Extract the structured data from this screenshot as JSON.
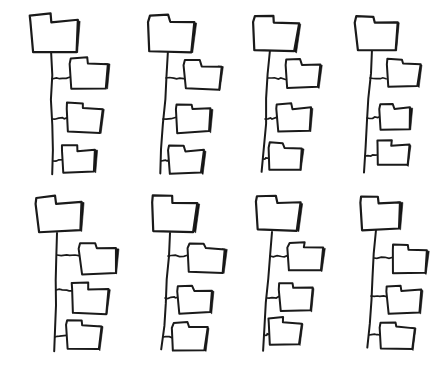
{
  "document": {
    "title": "Hand-drawn folder tree diagrams",
    "description": "A grid of eight hand-drawn folder hierarchy sketches, each showing one parent folder connected by a vertical trunk line to three child folders.",
    "background_color": "#ffffff",
    "ink_color": "#1a1a1a",
    "shadow_color": "#111111",
    "canvas": {
      "width": 447,
      "height": 375
    }
  },
  "layout": {
    "type": "grid",
    "columns": 4,
    "rows": 2,
    "total_trees": 8,
    "children_per_tree": 3
  },
  "icons": {
    "folder": "folder-icon",
    "trunk": "tree-trunk-line",
    "branch": "tree-branch-line"
  },
  "trees": [
    {
      "id": "tree-1",
      "row": 1,
      "column": 1,
      "parent": {
        "label": "folder-parent",
        "x": 30,
        "y": 14,
        "w": 48,
        "h": 38,
        "tilt": -1.5,
        "shadow_w": 8
      },
      "trunk": {
        "x1": 51,
        "y1": 50,
        "x2": 53,
        "y2": 174,
        "width": 2.0
      },
      "children": [
        {
          "label": "folder-child",
          "x": 70,
          "y": 58,
          "w": 38,
          "h": 30,
          "tilt": -1.0,
          "shadow_w": 7,
          "branch": {
            "x1": 52,
            "y1": 79,
            "x2": 70,
            "y2": 78,
            "width": 1.7
          }
        },
        {
          "label": "folder-child",
          "x": 66,
          "y": 103,
          "w": 36,
          "h": 29,
          "tilt": 1.0,
          "shadow_w": 7,
          "branch": {
            "x1": 52,
            "y1": 119,
            "x2": 68,
            "y2": 118,
            "width": 1.7
          }
        },
        {
          "label": "folder-child",
          "x": 62,
          "y": 145,
          "w": 34,
          "h": 27,
          "tilt": -1.5,
          "shadow_w": 6,
          "branch": {
            "x1": 53,
            "y1": 161,
            "x2": 64,
            "y2": 160,
            "width": 1.7
          }
        }
      ]
    },
    {
      "id": "tree-2",
      "row": 1,
      "column": 2,
      "parent": {
        "label": "folder-parent",
        "x": 148,
        "y": 15,
        "w": 46,
        "h": 36,
        "tilt": 1.2,
        "shadow_w": 8
      },
      "trunk": {
        "x1": 168,
        "y1": 50,
        "x2": 160,
        "y2": 174,
        "width": 2.0
      },
      "children": [
        {
          "label": "folder-child",
          "x": 184,
          "y": 60,
          "w": 37,
          "h": 29,
          "tilt": 1.5,
          "shadow_w": 7,
          "branch": {
            "x1": 166,
            "y1": 78,
            "x2": 184,
            "y2": 79,
            "width": 1.7
          }
        },
        {
          "label": "folder-child",
          "x": 176,
          "y": 104,
          "w": 35,
          "h": 28,
          "tilt": -1.2,
          "shadow_w": 7,
          "branch": {
            "x1": 163,
            "y1": 119,
            "x2": 177,
            "y2": 118,
            "width": 1.7
          }
        },
        {
          "label": "folder-child",
          "x": 168,
          "y": 145,
          "w": 36,
          "h": 28,
          "tilt": 1.0,
          "shadow_w": 6,
          "branch": {
            "x1": 161,
            "y1": 161,
            "x2": 170,
            "y2": 160,
            "width": 1.7
          }
        }
      ]
    },
    {
      "id": "tree-3",
      "row": 1,
      "column": 3,
      "parent": {
        "label": "folder-parent",
        "x": 253,
        "y": 16,
        "w": 45,
        "h": 35,
        "tilt": 2.0,
        "shadow_w": 8
      },
      "trunk": {
        "x1": 270,
        "y1": 50,
        "x2": 262,
        "y2": 172,
        "width": 2.0
      },
      "children": [
        {
          "label": "folder-child",
          "x": 285,
          "y": 59,
          "w": 35,
          "h": 28,
          "tilt": 1.0,
          "shadow_w": 7,
          "branch": {
            "x1": 268,
            "y1": 78,
            "x2": 285,
            "y2": 79,
            "width": 1.7
          }
        },
        {
          "label": "folder-child",
          "x": 277,
          "y": 103,
          "w": 34,
          "h": 28,
          "tilt": -1.5,
          "shadow_w": 7,
          "branch": {
            "x1": 265,
            "y1": 119,
            "x2": 278,
            "y2": 118,
            "width": 1.7
          }
        },
        {
          "label": "folder-child",
          "x": 268,
          "y": 143,
          "w": 34,
          "h": 26,
          "tilt": 1.5,
          "shadow_w": 6,
          "branch": {
            "x1": 263,
            "y1": 159,
            "x2": 270,
            "y2": 158,
            "width": 1.7
          }
        }
      ]
    },
    {
      "id": "tree-4",
      "row": 1,
      "column": 4,
      "parent": {
        "label": "folder-parent",
        "x": 355,
        "y": 16,
        "w": 42,
        "h": 34,
        "tilt": -1.0,
        "shadow_w": 8
      },
      "trunk": {
        "x1": 372,
        "y1": 49,
        "x2": 364,
        "y2": 172,
        "width": 2.0
      },
      "children": [
        {
          "label": "folder-child",
          "x": 387,
          "y": 59,
          "w": 33,
          "h": 27,
          "tilt": 1.2,
          "shadow_w": 6,
          "branch": {
            "x1": 370,
            "y1": 78,
            "x2": 387,
            "y2": 78,
            "width": 1.7
          }
        },
        {
          "label": "folder-child",
          "x": 379,
          "y": 103,
          "w": 32,
          "h": 26,
          "tilt": -1.0,
          "shadow_w": 6,
          "branch": {
            "x1": 367,
            "y1": 118,
            "x2": 380,
            "y2": 117,
            "width": 1.7
          }
        },
        {
          "label": "folder-child",
          "x": 377,
          "y": 140,
          "w": 32,
          "h": 25,
          "tilt": 1.0,
          "shadow_w": 6,
          "branch": {
            "x1": 365,
            "y1": 156,
            "x2": 378,
            "y2": 155,
            "width": 1.7
          }
        }
      ]
    },
    {
      "id": "tree-5",
      "row": 2,
      "column": 1,
      "parent": {
        "label": "folder-parent",
        "x": 36,
        "y": 196,
        "w": 46,
        "h": 35,
        "tilt": -1.8,
        "shadow_w": 8
      },
      "trunk": {
        "x1": 57,
        "y1": 233,
        "x2": 55,
        "y2": 352,
        "width": 2.0
      },
      "children": [
        {
          "label": "folder-child",
          "x": 79,
          "y": 243,
          "w": 38,
          "h": 30,
          "tilt": -1.0,
          "shadow_w": 7,
          "branch": {
            "x1": 57,
            "y1": 255,
            "x2": 79,
            "y2": 255,
            "width": 1.7
          }
        },
        {
          "label": "folder-child",
          "x": 71,
          "y": 283,
          "w": 37,
          "h": 30,
          "tilt": 1.2,
          "shadow_w": 7,
          "branch": {
            "x1": 56,
            "y1": 290,
            "x2": 73,
            "y2": 290,
            "width": 1.7
          }
        },
        {
          "label": "folder-child",
          "x": 66,
          "y": 320,
          "w": 35,
          "h": 29,
          "tilt": 1.5,
          "shadow_w": 6,
          "branch": {
            "x1": 55,
            "y1": 337,
            "x2": 68,
            "y2": 336,
            "width": 1.7
          }
        }
      ]
    },
    {
      "id": "tree-6",
      "row": 2,
      "column": 2,
      "parent": {
        "label": "folder-parent",
        "x": 152,
        "y": 196,
        "w": 45,
        "h": 35,
        "tilt": 1.5,
        "shadow_w": 8
      },
      "trunk": {
        "x1": 170,
        "y1": 233,
        "x2": 162,
        "y2": 350,
        "width": 2.0
      },
      "children": [
        {
          "label": "folder-child",
          "x": 188,
          "y": 243,
          "w": 37,
          "h": 29,
          "tilt": 1.0,
          "shadow_w": 7,
          "branch": {
            "x1": 168,
            "y1": 256,
            "x2": 188,
            "y2": 256,
            "width": 1.7
          }
        },
        {
          "label": "folder-child",
          "x": 178,
          "y": 286,
          "w": 34,
          "h": 27,
          "tilt": -1.2,
          "shadow_w": 7,
          "branch": {
            "x1": 165,
            "y1": 298,
            "x2": 179,
            "y2": 297,
            "width": 1.7
          }
        },
        {
          "label": "folder-child",
          "x": 172,
          "y": 322,
          "w": 35,
          "h": 28,
          "tilt": 1.0,
          "shadow_w": 6,
          "branch": {
            "x1": 163,
            "y1": 337,
            "x2": 174,
            "y2": 337,
            "width": 1.7
          }
        }
      ]
    },
    {
      "id": "tree-7",
      "row": 2,
      "column": 3,
      "parent": {
        "label": "folder-parent",
        "x": 256,
        "y": 196,
        "w": 44,
        "h": 34,
        "tilt": 1.2,
        "shadow_w": 8
      },
      "trunk": {
        "x1": 272,
        "y1": 232,
        "x2": 263,
        "y2": 350,
        "width": 2.0
      },
      "children": [
        {
          "label": "folder-child",
          "x": 288,
          "y": 242,
          "w": 35,
          "h": 28,
          "tilt": 1.5,
          "shadow_w": 7,
          "branch": {
            "x1": 270,
            "y1": 256,
            "x2": 288,
            "y2": 256,
            "width": 1.7
          }
        },
        {
          "label": "folder-child",
          "x": 278,
          "y": 283,
          "w": 34,
          "h": 28,
          "tilt": -1.0,
          "shadow_w": 7,
          "branch": {
            "x1": 267,
            "y1": 298,
            "x2": 279,
            "y2": 297,
            "width": 1.7
          }
        },
        {
          "label": "folder-child",
          "x": 268,
          "y": 318,
          "w": 33,
          "h": 26,
          "tilt": 1.2,
          "shadow_w": 6,
          "branch": {
            "x1": 264,
            "y1": 335,
            "x2": 270,
            "y2": 334,
            "width": 1.7
          }
        }
      ]
    },
    {
      "id": "tree-8",
      "row": 2,
      "column": 4,
      "parent": {
        "label": "folder-parent",
        "x": 360,
        "y": 196,
        "w": 41,
        "h": 33,
        "tilt": -1.2,
        "shadow_w": 7
      },
      "trunk": {
        "x1": 376,
        "y1": 230,
        "x2": 368,
        "y2": 348,
        "width": 2.0
      },
      "children": [
        {
          "label": "folder-child",
          "x": 392,
          "y": 245,
          "w": 35,
          "h": 28,
          "tilt": 1.0,
          "shadow_w": 7,
          "branch": {
            "x1": 374,
            "y1": 258,
            "x2": 392,
            "y2": 258,
            "width": 1.7
          }
        },
        {
          "label": "folder-child",
          "x": 386,
          "y": 285,
          "w": 35,
          "h": 28,
          "tilt": -1.0,
          "shadow_w": 7,
          "branch": {
            "x1": 371,
            "y1": 296,
            "x2": 387,
            "y2": 296,
            "width": 1.7
          }
        },
        {
          "label": "folder-child",
          "x": 380,
          "y": 322,
          "w": 34,
          "h": 27,
          "tilt": 1.2,
          "shadow_w": 6,
          "branch": {
            "x1": 369,
            "y1": 335,
            "x2": 381,
            "y2": 335,
            "width": 1.7
          }
        }
      ]
    }
  ]
}
